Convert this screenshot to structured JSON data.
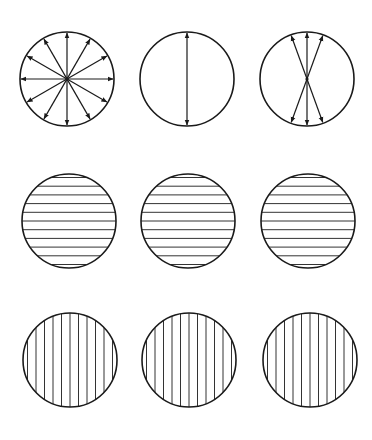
{
  "diagram": {
    "title": "",
    "stroke_color": "#1a1a1a",
    "line_color": "#333333",
    "background": "#ffffff",
    "rows": [
      {
        "name": "arrow-row",
        "cells": [
          {
            "name": "unpolarized-light",
            "cx": 67,
            "cy": 79,
            "r": 47,
            "type": "arrows",
            "angles_deg": [
              0,
              30,
              60,
              90,
              120,
              150
            ]
          },
          {
            "name": "linear-polarized-light",
            "cx": 187,
            "cy": 79,
            "r": 47,
            "type": "arrows",
            "angles_deg": [
              90
            ]
          },
          {
            "name": "partially-polarized-light",
            "cx": 307,
            "cy": 79,
            "r": 47,
            "type": "arrows",
            "angles_deg": [
              70,
              90,
              110
            ]
          }
        ]
      },
      {
        "name": "horizontal-lines-row",
        "cells": [
          {
            "name": "horizontal-filter-1",
            "cx": 69,
            "cy": 221,
            "r": 47,
            "type": "hlines",
            "spacing": 8.7,
            "count": 11
          },
          {
            "name": "horizontal-filter-2",
            "cx": 188,
            "cy": 221,
            "r": 47,
            "type": "hlines",
            "spacing": 8.7,
            "count": 11
          },
          {
            "name": "horizontal-filter-3",
            "cx": 308,
            "cy": 221,
            "r": 47,
            "type": "hlines",
            "spacing": 8.7,
            "count": 11
          }
        ]
      },
      {
        "name": "vertical-lines-row",
        "cells": [
          {
            "name": "vertical-filter-1",
            "cx": 70,
            "cy": 360,
            "r": 47,
            "type": "vlines",
            "spacing": 8.5,
            "count": 11
          },
          {
            "name": "vertical-filter-2",
            "cx": 189,
            "cy": 360,
            "r": 47,
            "type": "vlines",
            "spacing": 8.5,
            "count": 11
          },
          {
            "name": "vertical-filter-3",
            "cx": 310,
            "cy": 360,
            "r": 47,
            "type": "vlines",
            "spacing": 8.5,
            "count": 11
          }
        ]
      }
    ]
  }
}
